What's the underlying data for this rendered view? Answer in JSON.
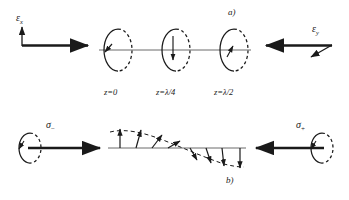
{
  "figure": {
    "title_implied": "Circular polarization standing wave diagram",
    "panels": [
      {
        "id": "a",
        "label": "a)",
        "x": 228,
        "y": 8
      },
      {
        "id": "b",
        "label": "b)",
        "x": 226,
        "y": 176
      }
    ],
    "colors": {
      "ink": "#1a1a1a",
      "line": "#555555",
      "background": "#ffffff"
    },
    "panel_a": {
      "left_beam": {
        "field_label": "ε",
        "field_subscript": "x",
        "arrow_direction": "right",
        "vertical_arrow": true,
        "axis_x1": 22,
        "axis_x2": 92,
        "axis_y": 45
      },
      "right_beam": {
        "field_label": "ε",
        "field_subscript": "y",
        "arrow_direction": "left",
        "diagonal_arrow": true,
        "axis_x1": 330,
        "axis_x2": 262,
        "axis_y": 45
      },
      "propagation_axis": {
        "x1": 98,
        "x2": 252,
        "y": 50
      },
      "ellipses": [
        {
          "cx": 118,
          "cy": 50,
          "rx": 14,
          "ry": 21,
          "rotation_arrow": "down-left",
          "z_label": "z=0",
          "z_label_x": 104
        },
        {
          "cx": 176,
          "cy": 50,
          "rx": 14,
          "ry": 21,
          "rotation_arrow": "down-center",
          "z_label": "z=λ/4",
          "z_label_x": 156
        },
        {
          "cx": 234,
          "cy": 50,
          "rx": 14,
          "ry": 21,
          "rotation_arrow": "up-left",
          "z_label": "z=λ/2",
          "z_label_x": 214
        }
      ],
      "z_labels_y": 92
    },
    "panel_b": {
      "left_source": {
        "sigma_label": "σ",
        "sigma_sign": "−",
        "arrow_direction": "right",
        "circle_cx": 30,
        "circle_cy": 148,
        "arrow_x1": 30,
        "arrow_x2": 100,
        "arrow_y": 148
      },
      "right_source": {
        "sigma_label": "σ",
        "sigma_sign": "+",
        "arrow_direction": "left",
        "circle_cx": 322,
        "circle_cy": 148,
        "arrow_x1": 322,
        "arrow_x2": 258,
        "arrow_y": 148
      },
      "baseline": {
        "x1": 108,
        "x2": 244,
        "y": 148
      },
      "vector_count": 8,
      "vectors": [
        {
          "x": 120,
          "angle_deg": 90,
          "length": 20,
          "tip_dir": "up"
        },
        {
          "x": 136,
          "angle_deg": 72,
          "length": 19,
          "tip_dir": "up"
        },
        {
          "x": 152,
          "angle_deg": 50,
          "length": 17,
          "tip_dir": "up"
        },
        {
          "x": 168,
          "angle_deg": 25,
          "length": 13,
          "tip_dir": "up"
        },
        {
          "x": 186,
          "angle_deg": -20,
          "length": 12,
          "tip_dir": "down"
        },
        {
          "x": 202,
          "angle_deg": -48,
          "length": 16,
          "tip_dir": "down"
        },
        {
          "x": 218,
          "angle_deg": -70,
          "length": 19,
          "tip_dir": "down"
        },
        {
          "x": 234,
          "angle_deg": -90,
          "length": 20,
          "tip_dir": "down"
        }
      ],
      "envelope_style": "dashed",
      "envelope_description": "dashed sinusoidal envelope tracing the vector tips"
    }
  }
}
